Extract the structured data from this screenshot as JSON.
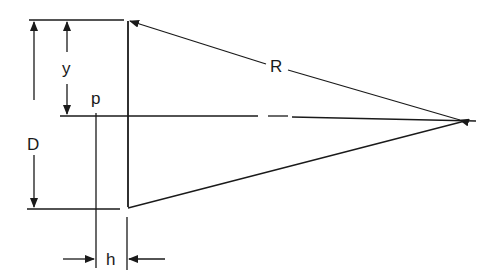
{
  "diagram": {
    "labels": {
      "D": "D",
      "y": "y",
      "p": "p",
      "R": "R",
      "h": "h"
    },
    "colors": {
      "ink": "#1a1a1a",
      "background": "#ffffff"
    }
  }
}
